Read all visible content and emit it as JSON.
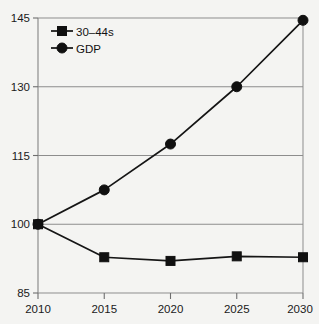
{
  "chart_data": {
    "type": "line",
    "title": "",
    "xlabel": "",
    "ylabel": "",
    "categories": [
      "2010",
      "2015",
      "2020",
      "2025",
      "2030"
    ],
    "x": [
      2010,
      2015,
      2020,
      2025,
      2030
    ],
    "xlim": [
      2010,
      2030
    ],
    "ylim": [
      85,
      145
    ],
    "yticks": [
      85,
      100,
      115,
      130,
      145
    ],
    "ytick_labels": [
      "85",
      "100",
      "115",
      "130",
      "145"
    ],
    "xtick_labels": [
      "2010",
      "2015",
      "2020",
      "2025",
      "2030"
    ],
    "grid": "horizontal",
    "legend_position": "top-left-inside",
    "series": [
      {
        "name": "30–44s",
        "marker": "square",
        "color": "#101010",
        "values": [
          100,
          92.8,
          92.0,
          93.0,
          92.8
        ]
      },
      {
        "name": "GDP",
        "marker": "circle",
        "color": "#101010",
        "values": [
          100,
          107.5,
          117.5,
          130.0,
          144.5
        ]
      }
    ]
  },
  "legend": {
    "items": [
      {
        "label": "30–44s",
        "marker": "square"
      },
      {
        "label": "GDP",
        "marker": "circle"
      }
    ]
  },
  "colors": {
    "background": "#f4f4f2",
    "ink": "#101010",
    "axis": "#8d8d8d"
  }
}
